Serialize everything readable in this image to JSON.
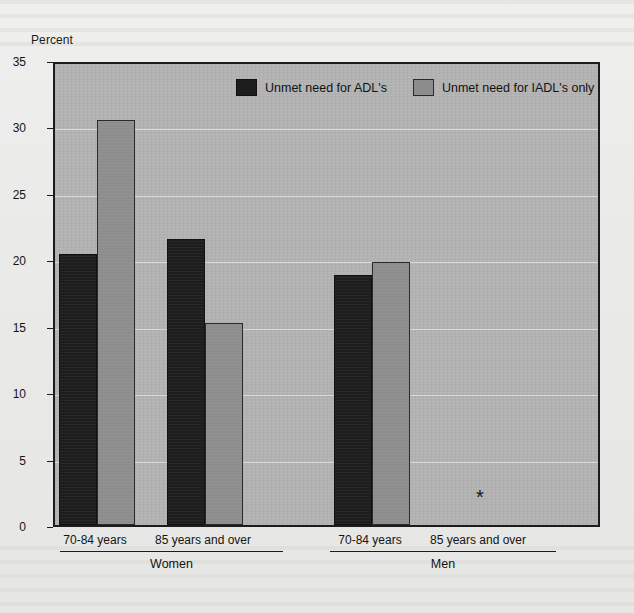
{
  "chart_data": {
    "type": "bar",
    "title": "",
    "subtitle": "",
    "xlabel": "",
    "ylabel": "Percent",
    "ylim": [
      0,
      35
    ],
    "ytick_step": 5,
    "yticks": [
      "0",
      "5",
      "10",
      "15",
      "20",
      "25",
      "30",
      "35"
    ],
    "grid": true,
    "legend_position": "inside-top-center",
    "categories": [
      "70-84 years",
      "85 years and over",
      "70-84 years",
      "85 years and over"
    ],
    "groups": [
      {
        "label": "Women",
        "categories": [
          "70-84 years",
          "85 years and over"
        ]
      },
      {
        "label": "Men",
        "categories": [
          "70-84 years",
          "85 years and over"
        ]
      }
    ],
    "series": [
      {
        "name": "Unmet need for ADL's",
        "color": "#1d1d1d",
        "values": [
          20.4,
          21.5,
          18.8,
          null
        ]
      },
      {
        "name": "Unmet need for IADL's only",
        "color": "#8d8d8d",
        "values": [
          30.5,
          15.2,
          19.8,
          null
        ]
      }
    ],
    "annotations": [
      {
        "category": "85 years and over",
        "group": "Men",
        "symbol": "*",
        "meaning": "no data / figure does not meet standards of reliability"
      }
    ]
  },
  "legend": {
    "items": [
      {
        "label": "Unmet need for ADL's",
        "color": "#1d1d1d"
      },
      {
        "label": "Unmet need for IADL's only",
        "color": "#8d8d8d"
      }
    ]
  },
  "axis": {
    "y_title": "Percent"
  },
  "colors": {
    "series_adl": "#1d1d1d",
    "series_iadl": "#8d8d8d",
    "plot_background": "#b2b2b2",
    "gridline": "#dadada",
    "frame": "#1c1c1c",
    "page_background": "#eaeae8"
  }
}
